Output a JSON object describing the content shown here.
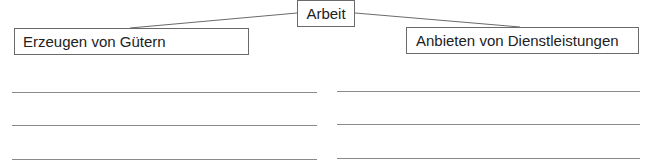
{
  "diagram": {
    "root": {
      "label": "Arbeit"
    },
    "branches": [
      {
        "label": "Erzeugen von Gütern",
        "answer_lines": 3
      },
      {
        "label": "Anbieten von Dienstleistungen",
        "answer_lines": 3
      }
    ]
  },
  "colors": {
    "border": "#6a6a6a",
    "line": "#8a8a8a",
    "text": "#222222"
  }
}
